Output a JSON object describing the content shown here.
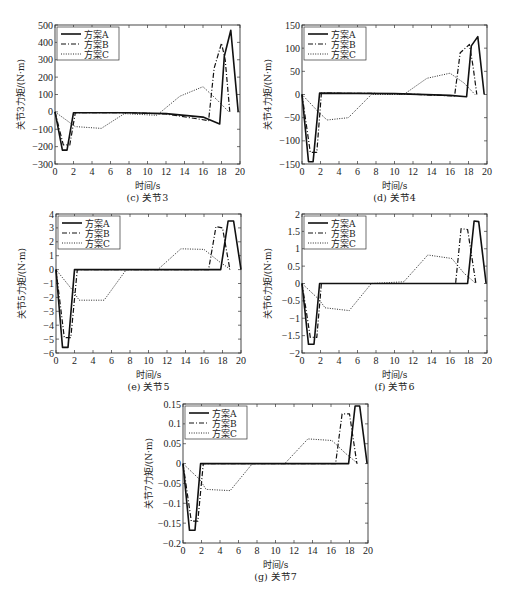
{
  "chart_data": [
    {
      "id": "c",
      "type": "line",
      "caption": "(c) 关节3",
      "xlabel": "时间/s",
      "ylabel": "关节3力矩/(N·m)",
      "xlim": [
        0,
        20
      ],
      "ylim": [
        -300,
        500
      ],
      "xticks": [
        0,
        2,
        4,
        6,
        8,
        10,
        12,
        14,
        16,
        18,
        20
      ],
      "yticks": [
        -300,
        -200,
        -100,
        0,
        100,
        200,
        300,
        400,
        500
      ],
      "ytick_labels": [
        "−300",
        "−200",
        "−100",
        "0",
        "100",
        "200",
        "300",
        "400",
        "500"
      ],
      "legend": {
        "position": "top-left",
        "entries": [
          "方案A",
          "方案B",
          "方案C"
        ]
      },
      "series": [
        {
          "name": "方案A",
          "style": "solid",
          "x": [
            0,
            0.8,
            1.3,
            2.0,
            8,
            12,
            16,
            17.8,
            18.3,
            19.0,
            19.8
          ],
          "y": [
            0,
            -220,
            -220,
            -5,
            -5,
            -10,
            -30,
            -70,
            320,
            470,
            0
          ]
        },
        {
          "name": "方案B",
          "style": "dashdot",
          "x": [
            0,
            0.9,
            1.6,
            2.2,
            8,
            12,
            16.6,
            17.2,
            18.0,
            18.4,
            18.9
          ],
          "y": [
            0,
            -190,
            -190,
            -5,
            -5,
            -12,
            -50,
            250,
            395,
            300,
            0
          ]
        },
        {
          "name": "方案C",
          "style": "dotted",
          "x": [
            0,
            2.2,
            5.0,
            7.5,
            11,
            13.5,
            16.0,
            17.5,
            18.8
          ],
          "y": [
            0,
            -85,
            -95,
            -10,
            -20,
            90,
            145,
            70,
            0
          ]
        }
      ]
    },
    {
      "id": "d",
      "type": "line",
      "caption": "(d) 关节4",
      "xlabel": "时间/s",
      "ylabel": "关节4力矩/(N·m)",
      "xlim": [
        0,
        20
      ],
      "ylim": [
        -150,
        150
      ],
      "xticks": [
        0,
        2,
        4,
        6,
        8,
        10,
        12,
        14,
        16,
        18,
        20
      ],
      "yticks": [
        -150,
        -100,
        -50,
        0,
        50,
        100,
        150
      ],
      "ytick_labels": [
        "−150",
        "−100",
        "−50",
        "0",
        "50",
        "100",
        "150"
      ],
      "legend": {
        "position": "top-left",
        "entries": [
          "方案A",
          "方案B",
          "方案C"
        ]
      },
      "series": [
        {
          "name": "方案A",
          "style": "solid",
          "x": [
            0,
            0.7,
            1.2,
            1.9,
            10,
            16,
            17.8,
            18.3,
            19.0,
            19.7
          ],
          "y": [
            0,
            -145,
            -145,
            3,
            2,
            -2,
            -5,
            105,
            125,
            0
          ]
        },
        {
          "name": "方案B",
          "style": "dashdot",
          "x": [
            0,
            0.9,
            1.6,
            2.1,
            10,
            16.5,
            17.1,
            18.1,
            18.5,
            18.9
          ],
          "y": [
            0,
            -125,
            -125,
            3,
            2,
            -3,
            90,
            108,
            60,
            0
          ]
        },
        {
          "name": "方案C",
          "style": "dotted",
          "x": [
            0,
            1.8,
            2.7,
            5.0,
            7.5,
            11,
            13.5,
            16.0,
            17.5,
            18.7
          ],
          "y": [
            0,
            -38,
            -55,
            -50,
            0,
            0,
            35,
            46,
            25,
            0
          ]
        }
      ]
    },
    {
      "id": "e",
      "type": "line",
      "caption": "(e) 关节5",
      "xlabel": "时间/s",
      "ylabel": "关节5力矩/(N·m)",
      "xlim": [
        0,
        20
      ],
      "ylim": [
        -6,
        4
      ],
      "xticks": [
        0,
        2,
        4,
        6,
        8,
        10,
        12,
        14,
        16,
        18,
        20
      ],
      "yticks": [
        -6,
        -5,
        -4,
        -3,
        -2,
        -1,
        0,
        1,
        2,
        3,
        4
      ],
      "ytick_labels": [
        "−6",
        "−5",
        "−4",
        "−3",
        "−2",
        "−1",
        "0",
        "1",
        "2",
        "3",
        "4"
      ],
      "legend": {
        "position": "top-left",
        "entries": [
          "方案A",
          "方案B",
          "方案C"
        ]
      },
      "series": [
        {
          "name": "方案A",
          "style": "solid",
          "x": [
            0,
            0.7,
            1.3,
            2.0,
            10,
            17.8,
            18.6,
            19.2,
            20.0
          ],
          "y": [
            0,
            -5.6,
            -5.6,
            0,
            0,
            0,
            3.5,
            3.5,
            0
          ]
        },
        {
          "name": "方案B",
          "style": "dashdot",
          "x": [
            0,
            0.9,
            1.6,
            2.3,
            10,
            16.5,
            17.3,
            18.0,
            18.8
          ],
          "y": [
            0,
            -4.9,
            -4.9,
            0,
            0,
            0,
            3.1,
            3.0,
            0
          ]
        },
        {
          "name": "方案C",
          "style": "dotted",
          "x": [
            0,
            1.8,
            2.5,
            5.2,
            7.6,
            11,
            13.5,
            16.0,
            17.6,
            18.9
          ],
          "y": [
            0,
            -1.5,
            -2.2,
            -2.2,
            0,
            0,
            1.5,
            1.45,
            0.6,
            0
          ]
        }
      ]
    },
    {
      "id": "f",
      "type": "line",
      "caption": "(f) 关节6",
      "xlabel": "时间/s",
      "ylabel": "关节6力矩/(N·m)",
      "xlim": [
        0,
        20
      ],
      "ylim": [
        -2,
        2
      ],
      "xticks": [
        0,
        2,
        4,
        6,
        8,
        10,
        12,
        14,
        16,
        18,
        20
      ],
      "yticks": [
        -2,
        -1.5,
        -1,
        -0.5,
        0,
        0.5,
        1,
        1.5,
        2
      ],
      "ytick_labels": [
        "−2",
        "−1.5",
        "−1",
        "−0.5",
        "0",
        "0.5",
        "1",
        "1.5",
        "2"
      ],
      "legend": {
        "position": "top-left",
        "entries": [
          "方案A",
          "方案B",
          "方案C"
        ]
      },
      "series": [
        {
          "name": "方案A",
          "style": "solid",
          "x": [
            0,
            0.7,
            1.3,
            1.9,
            10,
            17.9,
            18.6,
            19.1,
            19.9
          ],
          "y": [
            0,
            -1.75,
            -1.75,
            0,
            0,
            0,
            1.8,
            1.78,
            0
          ]
        },
        {
          "name": "方案B",
          "style": "dashdot",
          "x": [
            0,
            0.9,
            1.6,
            2.1,
            10,
            16.6,
            17.2,
            17.9,
            18.8
          ],
          "y": [
            0,
            -1.55,
            -1.55,
            0,
            0,
            0,
            1.58,
            1.55,
            0
          ]
        },
        {
          "name": "方案C",
          "style": "dotted",
          "x": [
            0,
            1.8,
            2.5,
            5.1,
            7.5,
            11,
            13.6,
            16.2,
            17.5,
            18.8
          ],
          "y": [
            0,
            -0.45,
            -0.7,
            -0.78,
            0,
            0.05,
            0.82,
            0.72,
            0.3,
            0
          ]
        }
      ]
    },
    {
      "id": "g",
      "type": "line",
      "caption": "(g) 关节7",
      "xlabel": "时间/s",
      "ylabel": "关节7力矩/(N·m)",
      "xlim": [
        0,
        20
      ],
      "ylim": [
        -0.2,
        0.15
      ],
      "xticks": [
        0,
        2,
        4,
        6,
        8,
        10,
        12,
        14,
        16,
        18,
        20
      ],
      "yticks": [
        -0.2,
        -0.15,
        -0.1,
        -0.05,
        0,
        0.05,
        0.1,
        0.15
      ],
      "ytick_labels": [
        "−0.2",
        "−0.15",
        "−0.1",
        "−0.05",
        "0",
        "0.05",
        "0.1",
        "0.15"
      ],
      "legend": {
        "position": "top-left",
        "entries": [
          "方案A",
          "方案B",
          "方案C"
        ]
      },
      "series": [
        {
          "name": "方案A",
          "style": "solid",
          "x": [
            0,
            0.7,
            1.3,
            1.9,
            10,
            17.9,
            18.6,
            19.1,
            19.9
          ],
          "y": [
            0,
            -0.168,
            -0.168,
            0,
            0,
            0,
            0.145,
            0.145,
            0
          ]
        },
        {
          "name": "方案B",
          "style": "dashdot",
          "x": [
            0,
            0.9,
            1.6,
            2.2,
            10,
            16.5,
            17.2,
            18.0,
            18.8
          ],
          "y": [
            0,
            -0.145,
            -0.145,
            0,
            0,
            0,
            0.125,
            0.125,
            0
          ]
        },
        {
          "name": "方案C",
          "style": "dotted",
          "x": [
            0,
            1.8,
            2.5,
            5.1,
            7.5,
            11,
            13.5,
            16.1,
            17.6,
            18.9
          ],
          "y": [
            0,
            -0.04,
            -0.065,
            -0.068,
            0,
            0,
            0.062,
            0.058,
            0.025,
            0
          ]
        }
      ]
    }
  ]
}
